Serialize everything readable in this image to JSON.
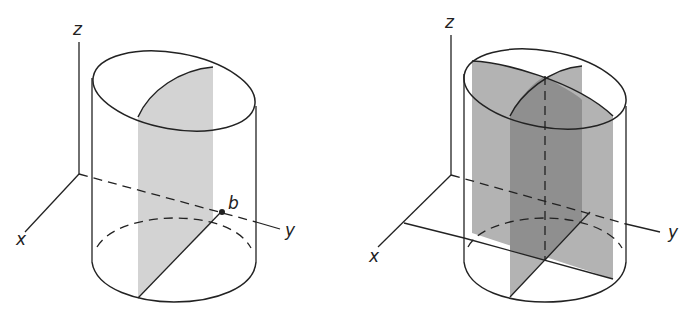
{
  "figure_left": {
    "title": "Cylinder with one cross-sectional slice",
    "labels": {
      "z": "z",
      "x": "x",
      "y": "y",
      "point": "b"
    },
    "colors": {
      "line": "#222222",
      "slice_fill": "#d3d3d3"
    }
  },
  "figure_right": {
    "title": "Cylinder with two perpendicular cross-sectional slices",
    "labels": {
      "z": "z",
      "x": "x",
      "y": "y"
    },
    "colors": {
      "line": "#222222",
      "slice_fill": "#b3b3b3",
      "overlap_fill": "#8f8f8f"
    }
  }
}
